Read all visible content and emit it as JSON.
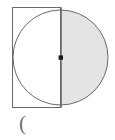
{
  "figure": {
    "background_color": "#ffffff",
    "stroke_color": "#595959",
    "shade_color": "#e4e4e4",
    "center_dot_color": "#1a1a1a",
    "circle": {
      "label": "circle-outline",
      "center_x": 60.5,
      "center_y": 57.5,
      "radius": 47.5,
      "stroke_width": 1
    },
    "diameter_line": {
      "label": "vertical-diameter",
      "x": 60.5,
      "y1": 7,
      "y2": 107.5,
      "stroke_width": 1.4
    },
    "shaded_half": {
      "label": "right-semicircle-shaded",
      "side": "right",
      "fill": "#e4e4e4"
    },
    "rectangle": {
      "label": "left-half-square",
      "x": 12,
      "y": 7,
      "width": 49,
      "height": 100.5,
      "stroke_width": 1
    },
    "center_point": {
      "label": "center-point",
      "x": 60.5,
      "y": 57.5,
      "size": 4.2
    }
  },
  "caption": {
    "text": "("
  }
}
